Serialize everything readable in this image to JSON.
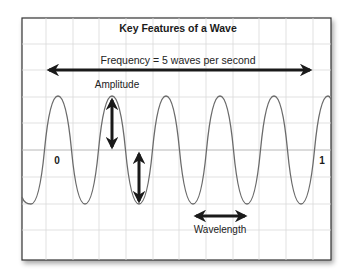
{
  "diagram": {
    "title": "Key Features of a Wave",
    "frequency_label": "Frequency = 5 waves per second",
    "amplitude_label": "Amplitude",
    "wavelength_label": "Wavelength",
    "axis_start_label": "0",
    "axis_end_label": "1",
    "colors": {
      "frame": "#333333",
      "grid": "#d9d9d9",
      "center_line": "#b8b8b8",
      "wave": "#6b6b6b",
      "arrow": "#1a1a1a",
      "shadow": "#bdbdbd"
    }
  },
  "wave": {
    "type": "sine",
    "cycles_per_second": 5,
    "x_range_seconds": [
      0,
      1
    ],
    "visible_peaks": 6,
    "visible_troughs": 6
  }
}
